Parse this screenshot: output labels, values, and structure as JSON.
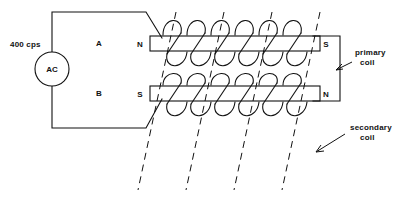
{
  "figure": {
    "background_color": "#ffffff",
    "line_color": "#111111",
    "width": 400,
    "height": 199
  },
  "source": {
    "frequency_label": "400 cps",
    "generator_label": "AC",
    "generator_symbol": "ac-source-circle"
  },
  "branches": {
    "upper_label": "A",
    "lower_label": "B"
  },
  "poles": {
    "upper_left": "N",
    "upper_right": "S",
    "lower_left": "S",
    "lower_right": "N"
  },
  "annotations": [
    {
      "id": "primary",
      "line1": "primary",
      "line2": "coil"
    },
    {
      "id": "secondary",
      "line1": "secondary",
      "line2": "coil"
    }
  ],
  "icons": {
    "primary_pointer": "arrow-left-icon",
    "secondary_pointer": "arrow-down-left-icon"
  }
}
